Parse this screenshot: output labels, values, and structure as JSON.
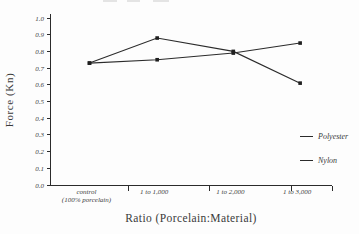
{
  "chart_data": {
    "type": "line",
    "title": "",
    "xlabel": "Ratio (Porcelain:Material)",
    "ylabel": "Force (Kn)",
    "categories": [
      {
        "lines": [
          "control",
          "(100% porcelain)"
        ]
      },
      {
        "lines": [
          "1 to 1,000"
        ]
      },
      {
        "lines": [
          "1 to 2,000"
        ]
      },
      {
        "lines": [
          "1 to 3,000"
        ]
      }
    ],
    "series": [
      {
        "name": "Polyester",
        "values": [
          0.73,
          0.88,
          0.8,
          0.61
        ]
      },
      {
        "name": "Nylon",
        "values": [
          0.73,
          0.75,
          0.79,
          0.85
        ]
      }
    ],
    "ylim": [
      0.0,
      1.0
    ],
    "ytick_step": 0.1,
    "ytick_labels": [
      "0.0",
      "0.1",
      "0.2",
      "0.3",
      "0.4",
      "0.5",
      "0.6",
      "0.7",
      "0.8",
      "0.9",
      "1.0"
    ],
    "grid": false,
    "legend_position": "right-middle",
    "line_color": "#2b2b2b",
    "marker": "square",
    "marker_color": "#1f1f1f",
    "text_color": "#3f3f3f",
    "background_color": "#fdfdfd"
  }
}
